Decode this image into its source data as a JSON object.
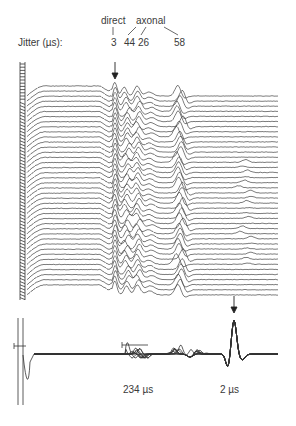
{
  "figure": {
    "jitter_label": "Jitter (µs):",
    "group_labels": {
      "direct": "direct",
      "axonal": "axonal"
    },
    "jitter_values": [
      "3",
      "44",
      "26",
      "58"
    ],
    "bottom_labels": {
      "left": "234 µs",
      "right": "2 µs"
    }
  },
  "chart_data": {
    "type": "line",
    "title": "",
    "upper_panel": {
      "trace_count": 40,
      "annotation": "Jitter (µs)",
      "components": [
        {
          "group": "direct",
          "jitter_us": 3,
          "marked_by_arrow": true
        },
        {
          "group": "axonal",
          "jitter_us": 44
        },
        {
          "group": "axonal",
          "jitter_us": 26
        },
        {
          "group": "axonal",
          "jitter_us": 58
        }
      ]
    },
    "lower_panel": {
      "annotations": [
        {
          "label": "234 µs",
          "position": "middle (blocking/variable components)"
        },
        {
          "label": "2 µs",
          "position": "right (stable spike, marked by arrow)"
        }
      ]
    },
    "xlabel": "",
    "ylabel": "",
    "grid": false,
    "legend": "none"
  }
}
